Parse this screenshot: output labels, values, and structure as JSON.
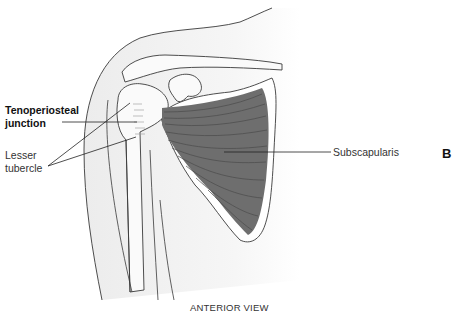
{
  "figure": {
    "panel_letter": "B",
    "caption": "ANTERIOR VIEW",
    "labels": {
      "tenoperiosteal_line1": "Tenoperiosteal",
      "tenoperiosteal_line2": "junction",
      "lesser_line1": "Lesser",
      "lesser_line2": "tubercle",
      "subscapularis": "Subscapularis"
    },
    "colors": {
      "muscle": "#6e6e6e",
      "muscle_fiber": "#4a4a4a",
      "outline": "#3a3a3a",
      "skin_fill": "#f2f2f2",
      "bone_fill": "#fafafa",
      "leader": "#222222"
    }
  }
}
